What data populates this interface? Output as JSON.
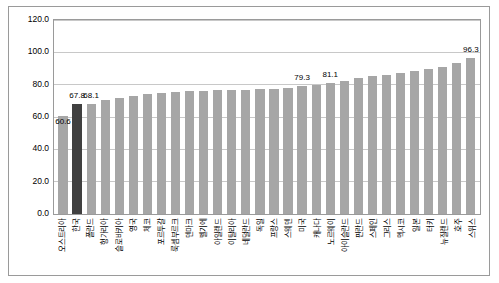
{
  "chart_data": {
    "type": "bar",
    "title": "",
    "subtitle": "",
    "xlabel": "",
    "ylabel": "",
    "ylim": [
      0,
      120
    ],
    "grid": true,
    "legend": "none",
    "yticks": [
      "0.0",
      "20.0",
      "40.0",
      "60.0",
      "80.0",
      "100.0",
      "120.0"
    ],
    "ytick_values": [
      0,
      20,
      40,
      60,
      80,
      100,
      120
    ],
    "categories": [
      "오스트리아",
      "한국",
      "폴란드",
      "헝가리아",
      "슬로바키아",
      "영국",
      "체코",
      "포르투갈",
      "룩셈부르크",
      "덴마크",
      "벨기에",
      "아일랜드",
      "이탈리아",
      "네덜란드",
      "독일",
      "프랑스",
      "스웨덴",
      "미국",
      "캐나다",
      "노르웨이",
      "아이슬란드",
      "핀란드",
      "스페인",
      "그리스",
      "멕시코",
      "일본",
      "터키",
      "뉴질랜드",
      "호주",
      "스위스"
    ],
    "values": [
      60.6,
      67.8,
      68.1,
      70.5,
      72.0,
      73.0,
      74.2,
      75.0,
      75.5,
      76.0,
      76.3,
      76.5,
      76.8,
      77.0,
      77.2,
      77.5,
      78.0,
      79.3,
      80.0,
      81.1,
      82.0,
      84.0,
      85.5,
      86.0,
      87.5,
      88.5,
      89.5,
      91.0,
      93.5,
      96.3
    ],
    "data_labels": [
      {
        "index": 0,
        "text": "60.6",
        "position": "inside"
      },
      {
        "index": 1,
        "text": "67.8",
        "position": "above"
      },
      {
        "index": 2,
        "text": "68.1",
        "position": "above"
      },
      {
        "index": 17,
        "text": "79.3",
        "position": "above"
      },
      {
        "index": 19,
        "text": "81.1",
        "position": "above"
      },
      {
        "index": 29,
        "text": "96.3",
        "position": "above"
      }
    ],
    "highlight_index": 1,
    "colors": {
      "bar": "#a6a6a6",
      "highlight_bar": "#404040",
      "grid": "#c8c8c8",
      "frame": "#9a9a9a",
      "text": "#000000",
      "background": "#ffffff"
    }
  }
}
